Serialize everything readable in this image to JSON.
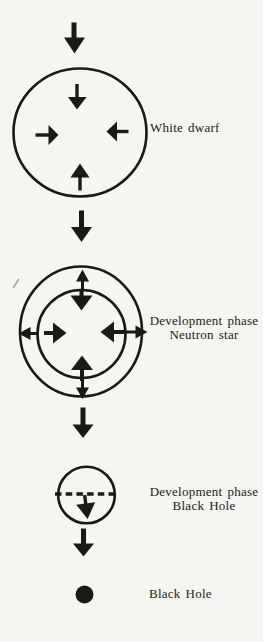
{
  "colors": {
    "paper": "#f6f5f1",
    "ink": "#1b1916",
    "label_text": "#201d18",
    "stray_mark": "#9b978e"
  },
  "figure": {
    "type": "diagram",
    "stages": [
      {
        "name": "white-dwarf",
        "label": "White dwarf"
      },
      {
        "name": "neutron-star-development",
        "label_line1": "Development phase",
        "label_line2": "Neutron star"
      },
      {
        "name": "black-hole-development",
        "label_line1": "Development phase",
        "label_line2": "Black Hole"
      },
      {
        "name": "black-hole",
        "label": "Black Hole"
      }
    ]
  }
}
